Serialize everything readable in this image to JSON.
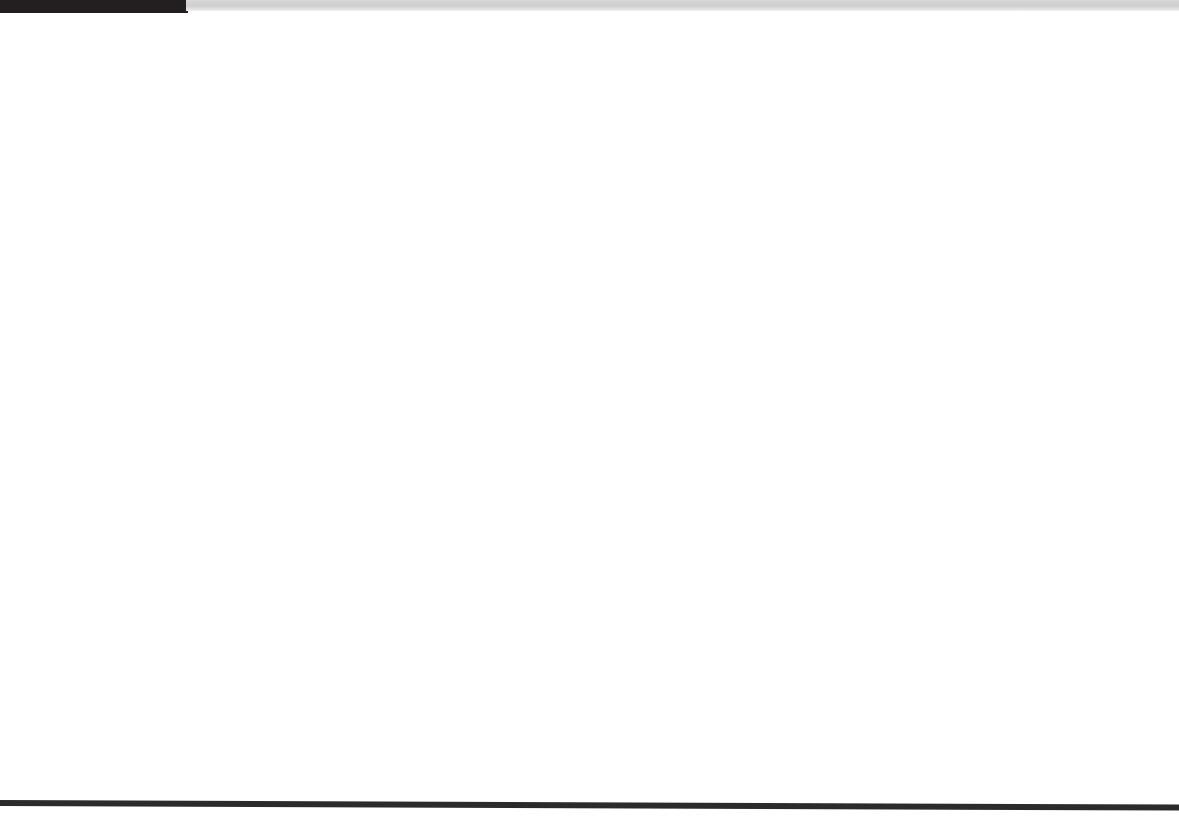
{
  "page": {
    "background_color": "#ffffff",
    "line_color": "#3a3a3a",
    "text_color": "#111111",
    "header_bar_dark_color": "#231f20",
    "header_bar_gray_color": "#d7d7d7",
    "footer_rule_color": "#2b2b2b"
  },
  "diagram": {
    "type": "hierarchy-tree",
    "nodes": [
      {
        "id": "root",
        "lines": [
          "Corporate Debt Securities"
        ],
        "italic": false,
        "x": 575,
        "y": 57,
        "w": 240,
        "h": 50,
        "parent": null
      },
      {
        "id": "corporate-bonds",
        "lines": [
          "Corporate",
          "Bonds"
        ],
        "italic": false,
        "x": 328,
        "y": 198,
        "w": 182,
        "h": 53,
        "parent": "root"
      },
      {
        "id": "medium-term-notes",
        "lines": [
          "Medium-Term",
          "Notes (MTNs)"
        ],
        "italic": false,
        "x": 617,
        "y": 194,
        "w": 178,
        "h": 58,
        "parent": "root"
      },
      {
        "id": "commercial-paper",
        "lines": [
          "Commercial",
          "Paper"
        ],
        "italic": false,
        "x": 903,
        "y": 196,
        "w": 182,
        "h": 54,
        "parent": "root"
      },
      {
        "id": "secured-bonds",
        "lines": [
          "Secured Bonds"
        ],
        "italic": false,
        "x": 120,
        "y": 398,
        "w": 180,
        "h": 54,
        "parent": "corporate-bonds"
      },
      {
        "id": "unsecured-bonds",
        "lines": [
          "Unsecured Bonds",
          "(Debenture Bonds)"
        ],
        "italic": false,
        "x": 331,
        "y": 393,
        "w": 178,
        "h": 58,
        "parent": "corporate-bonds"
      },
      {
        "id": "credit-enhanced-bonds",
        "lines": [
          "Credit Enhanced",
          "Bonds"
        ],
        "italic": false,
        "x": 549,
        "y": 393,
        "w": 180,
        "h": 58,
        "parent": "corporate-bonds"
      },
      {
        "id": "directly-placed",
        "lines": [
          "Directly-",
          "placed"
        ],
        "italic": false,
        "x": 871,
        "y": 394,
        "w": 108,
        "h": 58,
        "parent": "commercial-paper"
      },
      {
        "id": "dealer-placed",
        "lines": [
          "Dealer-",
          "placed"
        ],
        "italic": false,
        "x": 1011,
        "y": 394,
        "w": 112,
        "h": 58,
        "parent": "commercial-paper"
      },
      {
        "id": "mortgage-debt",
        "lines": [
          "Mortgage Debt"
        ],
        "italic": false,
        "x": 47,
        "y": 541,
        "w": 152,
        "h": 57,
        "parent": "secured-bonds"
      },
      {
        "id": "collateral-trust-bonds",
        "lines": [
          "Collateral",
          "Trust Bonds"
        ],
        "italic": false,
        "x": 226,
        "y": 541,
        "w": 150,
        "h": 57,
        "parent": "secured-bonds"
      },
      {
        "id": "guaranteed-by-a",
        "lines": [
          "Guaranteed by a:"
        ],
        "italic": true,
        "x": 550,
        "y": 541,
        "w": 178,
        "h": 54,
        "parent": "credit-enhanced-bonds"
      },
      {
        "id": "secured-by-real-property",
        "lines": [
          "Secured by",
          "real property",
          "or personal",
          "property"
        ],
        "italic": true,
        "x": 50,
        "y": 671,
        "w": 148,
        "h": 112,
        "parent": "mortgage-debt"
      },
      {
        "id": "secured-by-financial-assets",
        "lines": [
          "Secured by",
          "financial assets"
        ],
        "italic": true,
        "x": 226,
        "y": 671,
        "w": 150,
        "h": 112,
        "parent": "collateral-trust-bonds"
      },
      {
        "id": "third-party",
        "lines": [
          "Third-party"
        ],
        "italic": false,
        "x": 441,
        "y": 695,
        "w": 150,
        "h": 56,
        "parent": "guaranteed-by-a"
      },
      {
        "id": "bank-letter-of-credit",
        "lines": [
          "Bank Letter",
          "of Credit"
        ],
        "italic": false,
        "x": 692,
        "y": 692,
        "w": 152,
        "h": 58,
        "parent": "guaranteed-by-a"
      }
    ],
    "edge_buses": [
      {
        "id": "bus-root",
        "parent": "root",
        "y": 160
      },
      {
        "id": "bus-corporate-bonds",
        "parent": "corporate-bonds",
        "y": 345
      },
      {
        "id": "bus-commercial-paper",
        "parent": "commercial-paper",
        "y": 350
      },
      {
        "id": "bus-secured-bonds",
        "parent": "secured-bonds",
        "y": 520
      },
      {
        "id": "bus-guaranteed",
        "parent": "guaranteed-by-a",
        "y": 660
      }
    ],
    "straight_edges": [
      {
        "from": "mortgage-debt",
        "to": "secured-by-real-property"
      },
      {
        "from": "collateral-trust-bonds",
        "to": "secured-by-financial-assets"
      },
      {
        "from": "credit-enhanced-bonds",
        "to": "guaranteed-by-a"
      }
    ]
  }
}
